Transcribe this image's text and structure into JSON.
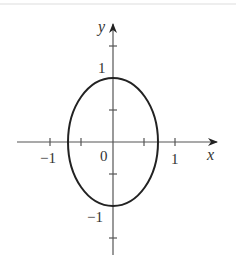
{
  "diagram": {
    "type": "ellipse-on-axes",
    "axes": {
      "x_label": "x",
      "y_label": "y",
      "origin_label": "0",
      "x_tick_labels": {
        "neg_one": "−1",
        "pos_one": "1"
      },
      "y_tick_labels": {
        "pos_one": "1",
        "neg_one": "−1"
      },
      "x_ticks": [
        -1,
        -0.5,
        0.5,
        1
      ],
      "y_ticks": [
        -1.5,
        -1,
        -0.5,
        0.5,
        1,
        1.5
      ]
    },
    "ellipse": {
      "center": [
        0,
        0
      ],
      "semi_axis_x": 0.72,
      "semi_axis_y": 1.0
    },
    "colors": {
      "curve": "#222222",
      "axes": "#555555",
      "text": "#333333"
    }
  }
}
